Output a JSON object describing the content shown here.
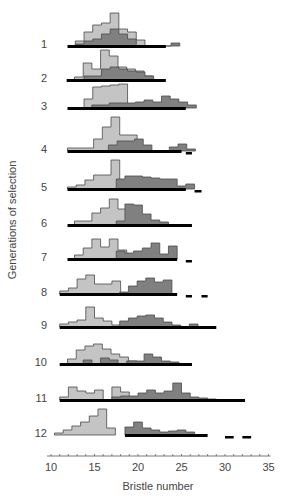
{
  "chart_data": {
    "type": "bar",
    "subtype": "stacked-row histograms (selection response)",
    "title": "",
    "xlabel": "Bristle number",
    "ylabel": "Generations of selection",
    "xlim": [
      10,
      35
    ],
    "xticks": [
      10,
      15,
      20,
      25,
      30,
      35
    ],
    "bin_width": 1,
    "colors": {
      "low_line": "#c4c4c4",
      "high_line": "#808080",
      "outline": "#4a4a4a",
      "range_bar": "#000000"
    },
    "legend": [],
    "note": "Each generation shows two overlapping histograms (light = low-selected line, dark = high-selected line); heights are relative frequencies estimated in pixels. Black bars below show the range of the distribution; short dashes show outliers.",
    "series": [
      {
        "generation": "1",
        "light": {
          "start": 12.8,
          "heights": [
            5,
            14,
            21,
            23,
            33,
            17,
            14,
            6
          ]
        },
        "dark": {
          "start": 12.8,
          "heights": [
            2,
            5,
            7,
            12,
            17,
            12,
            7,
            0,
            0,
            0,
            0,
            3
          ]
        },
        "range": [
          11.9,
          23.2
        ],
        "outliers": []
      },
      {
        "generation": "2",
        "light": {
          "start": 12.7,
          "heights": [
            3,
            17,
            11,
            30,
            24,
            13,
            11,
            9,
            4
          ]
        },
        "dark": {
          "start": 13.8,
          "heights": [
            4,
            4,
            11,
            13,
            11,
            9,
            8,
            4
          ]
        },
        "range": [
          11.8,
          23.2
        ],
        "outliers": []
      },
      {
        "generation": "3",
        "light": {
          "start": 13.8,
          "heights": [
            9,
            21,
            22,
            23,
            24
          ]
        },
        "dark": {
          "start": 14.7,
          "heights": [
            3,
            3,
            5,
            5,
            5,
            6,
            8,
            6,
            12,
            9,
            6,
            3
          ]
        },
        "range": [
          11.9,
          25.5
        ],
        "outliers": []
      },
      {
        "generation": "4",
        "light": {
          "start": 11.9,
          "heights": [
            3,
            3,
            3,
            12,
            24,
            34,
            16,
            16
          ]
        },
        "dark": {
          "start": 16.6,
          "heights": [
            6,
            10,
            10,
            12,
            6,
            0,
            0,
            4,
            7,
            2
          ]
        },
        "range": [
          11.9,
          25.0
        ],
        "outliers": [
          [
            25.5,
            26.2
          ]
        ]
      },
      {
        "generation": "5",
        "light": {
          "start": 11.9,
          "heights": [
            2,
            4,
            9,
            14,
            14,
            29
          ]
        },
        "dark": {
          "start": 17.5,
          "heights": [
            10,
            13,
            13,
            12,
            11,
            10,
            10,
            3,
            5
          ]
        },
        "range": [
          11.9,
          25.5
        ],
        "outliers": [
          [
            26.5,
            27.3
          ]
        ]
      },
      {
        "generation": "6",
        "light": {
          "start": 12.7,
          "heights": [
            4,
            4,
            12,
            17,
            26,
            16
          ]
        },
        "dark": {
          "start": 17.5,
          "heights": [
            4,
            21,
            20,
            11,
            5,
            3
          ]
        },
        "range": [
          11.9,
          26.2
        ],
        "outliers": []
      },
      {
        "generation": "7",
        "light": {
          "start": 12.7,
          "heights": [
            4,
            11,
            20,
            12,
            20,
            9
          ]
        },
        "dark": {
          "start": 17.5,
          "heights": [
            8,
            6,
            8,
            11,
            16,
            5,
            13
          ]
        },
        "range": [
          11.9,
          24.5
        ],
        "outliers": [
          [
            25.5,
            26.2
          ]
        ]
      },
      {
        "generation": "8",
        "light": {
          "start": 11.0,
          "heights": [
            3,
            6,
            15,
            19,
            10,
            10,
            13
          ]
        },
        "dark": {
          "start": 17.9,
          "heights": [
            2,
            8,
            13,
            16,
            12,
            14
          ]
        },
        "range": [
          11.0,
          24.5
        ],
        "outliers": [
          [
            25.5,
            26.2
          ],
          [
            27.3,
            28.0
          ]
        ]
      },
      {
        "generation": "9",
        "light": {
          "start": 11.0,
          "heights": [
            3,
            5,
            7,
            20,
            9,
            6,
            2
          ]
        },
        "dark": {
          "start": 17.9,
          "heights": [
            6,
            9,
            11,
            12,
            9,
            5,
            2,
            0,
            3
          ]
        },
        "range": [
          11.0,
          29.0
        ],
        "outliers": []
      },
      {
        "generation": "10",
        "light": {
          "start": 11.9,
          "heights": [
            5,
            14,
            18,
            20,
            15,
            10,
            7,
            3
          ]
        },
        "dark": {
          "start": 12.7,
          "heights": [
            0,
            4,
            0,
            6,
            4,
            0,
            3,
            3,
            10,
            7,
            3,
            2
          ]
        },
        "range": [
          11.0,
          26.2
        ],
        "outliers": []
      },
      {
        "generation": "11",
        "light": {
          "start": 11.0,
          "heights": [
            3,
            13,
            9,
            7,
            10,
            0,
            13,
            8,
            3
          ]
        },
        "dark": {
          "start": 17.0,
          "heights": [
            3,
            4,
            4,
            7,
            10,
            7,
            9,
            17,
            7,
            3,
            2,
            1
          ]
        },
        "range": [
          11.0,
          32.3
        ],
        "outliers": []
      },
      {
        "generation": "12",
        "light": {
          "start": 10.4,
          "heights": [
            2,
            5,
            9,
            13,
            19,
            26,
            7
          ]
        },
        "dark": {
          "start": 18.5,
          "heights": [
            8,
            13,
            7,
            5,
            3,
            4,
            5,
            3
          ]
        },
        "range": [
          18.5,
          28.0
        ],
        "outliers": [
          [
            30.0,
            31.0
          ],
          [
            32.0,
            33.0
          ]
        ]
      }
    ]
  },
  "labels": {
    "y_axis_title": "Generations of selection",
    "x_axis_title": "Bristle number"
  }
}
